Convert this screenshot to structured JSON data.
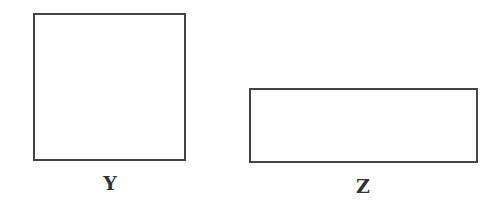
{
  "figures": [
    {
      "id": "Y",
      "label": "Y",
      "shape": "square"
    },
    {
      "id": "Z",
      "label": "Z",
      "shape": "rectangle"
    }
  ]
}
